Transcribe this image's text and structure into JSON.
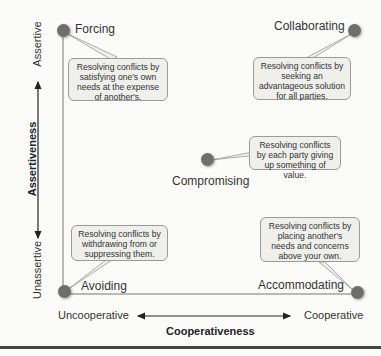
{
  "diagram": {
    "type": "conflict-resolution-grid",
    "y_axis": {
      "title": "Assertiveness",
      "top_label": "Assertive",
      "bottom_label": "Unassertive"
    },
    "x_axis": {
      "title": "Cooperativeness",
      "left_label": "Uncooperative",
      "right_label": "Cooperative"
    },
    "styles": [
      {
        "id": "forcing",
        "label": "Forcing",
        "description": "Resolving conflicts by satisfying one's own needs at the expense of another's."
      },
      {
        "id": "collaborating",
        "label": "Collaborating",
        "description": "Resolving conflicts by seeking an advantageous solution for all parties."
      },
      {
        "id": "compromising",
        "label": "Compromising",
        "description": "Resolving conflicts by each party giving up something of value."
      },
      {
        "id": "avoiding",
        "label": "Avoiding",
        "description": "Resolving conflicts by withdrawing from or suppressing them."
      },
      {
        "id": "accommodating",
        "label": "Accommodating",
        "description": "Resolving conflicts by placing another's needs and concerns above your own."
      }
    ],
    "colors": {
      "dot": "#6e6e6e",
      "bubble_fill": "#efefec",
      "bubble_border": "#9a9a9a",
      "axis": "#222222"
    }
  }
}
